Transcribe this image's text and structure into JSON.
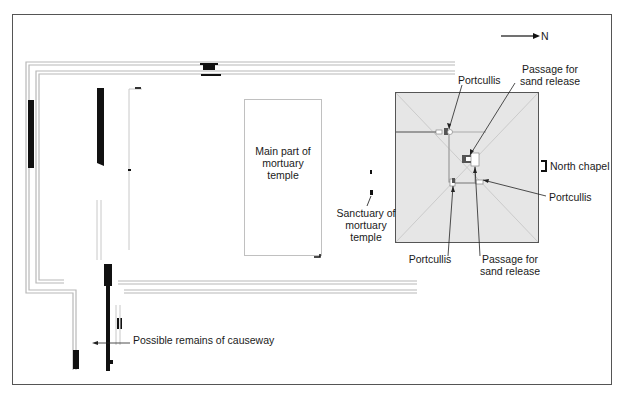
{
  "compass": {
    "label": "N",
    "direction": "right"
  },
  "labels": {
    "main_temple": "Main part of\nmortuary\ntemple",
    "sanctuary": "Sanctuary of\nmortuary\ntemple",
    "portcullis_top": "Portcullis",
    "passage_top": "Passage for\nsand release",
    "north_chapel": "North chapel",
    "portcullis_right": "Portcullis",
    "portcullis_bottom": "Portcullis",
    "passage_bottom": "Passage for\nsand release",
    "causeway": "Possible remains of causeway"
  },
  "colors": {
    "frame": "#555555",
    "wall": "#b8b8b8",
    "solid": "#111111",
    "pyramid_fill": "#e6e6e6",
    "pyramid_edge": "#555555",
    "diagonal": "#c4c4c4",
    "corridor": "#9a9a9a"
  }
}
